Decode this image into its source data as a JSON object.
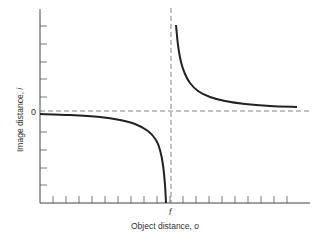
{
  "chart_data": {
    "type": "line",
    "title": "",
    "xlabel": "Object distance, o",
    "ylabel": "Image distance, i",
    "x_special_tick_label": "f",
    "y_zero_label": "0",
    "grid": false,
    "legend": null,
    "asymptotes": {
      "vertical": "o = f (dashed)",
      "horizontal": "i = 0 (dashed)"
    },
    "x_ticks_count": 19,
    "y_ticks_above_zero": 5,
    "y_ticks_below_zero": 4,
    "series": [
      {
        "name": "real image branch (o > f)",
        "points_px": [
          [
            176,
            25
          ],
          [
            178,
            45
          ],
          [
            181,
            62
          ],
          [
            185,
            74
          ],
          [
            190,
            83
          ],
          [
            198,
            91
          ],
          [
            210,
            97
          ],
          [
            225,
            101
          ],
          [
            245,
            104
          ],
          [
            270,
            106
          ],
          [
            297,
            107
          ]
        ]
      },
      {
        "name": "virtual image branch (o < f)",
        "points_px": [
          [
            40,
            114
          ],
          [
            70,
            115
          ],
          [
            100,
            117
          ],
          [
            120,
            120
          ],
          [
            135,
            124
          ],
          [
            148,
            131
          ],
          [
            156,
            140
          ],
          [
            160,
            150
          ],
          [
            163,
            165
          ],
          [
            165,
            185
          ],
          [
            166,
            203
          ]
        ]
      }
    ],
    "colors": {
      "curve": "#222222",
      "axis": "#444444",
      "dashed": "#777777"
    }
  },
  "axes": {
    "x_label": "Object distance, ",
    "x_label_var": "o",
    "y_label": "Image distance, ",
    "y_label_var": "i",
    "f_label": "f",
    "zero_label": "0"
  }
}
